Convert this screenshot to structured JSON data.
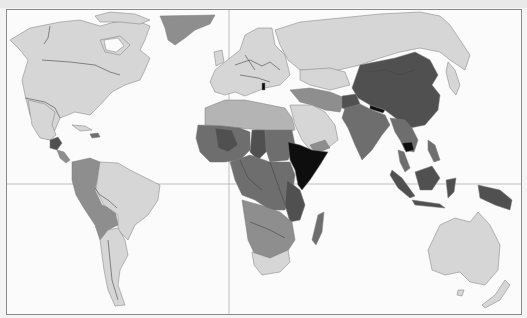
{
  "map": {
    "type": "choropleth",
    "projection": "equirectangular-like world map",
    "legend_visible": false,
    "title_visible": false,
    "gridlines": {
      "prime_meridian_x": 229,
      "equator_y": 184
    },
    "palette": {
      "ocean": "#fbfbfb",
      "shade_1_lowest": "#d6d6d6",
      "shade_2": "#b4b4b4",
      "shade_3": "#8e8e8e",
      "shade_4": "#6e6e6e",
      "shade_5": "#505050",
      "shade_6_highest": "#0e0e0e",
      "frame": "#8a8a8a",
      "grid": "#a8a8a8"
    },
    "regions": [
      {
        "name": "North America (Canada, USA)",
        "shade": "shade_1_lowest"
      },
      {
        "name": "Greenland",
        "shade": "shade_3"
      },
      {
        "name": "Mexico",
        "shade": "shade_1_lowest"
      },
      {
        "name": "Central America (Guatemala, Honduras)",
        "shade": "shade_5"
      },
      {
        "name": "Caribbean (Haiti)",
        "shade": "shade_4"
      },
      {
        "name": "South America west (Colombia, Ecuador, Peru, Bolivia)",
        "shade": "shade_3"
      },
      {
        "name": "Brazil, Argentina, Chile",
        "shade": "shade_1_lowest"
      },
      {
        "name": "Europe",
        "shade": "shade_1_lowest"
      },
      {
        "name": "Albania",
        "shade": "shade_6_highest"
      },
      {
        "name": "Russia",
        "shade": "shade_1_lowest"
      },
      {
        "name": "North Africa (Algeria, Libya, Egypt)",
        "shade": "shade_2"
      },
      {
        "name": "West Africa / Sahel",
        "shade": "shade_4"
      },
      {
        "name": "Mali, Chad",
        "shade": "shade_5"
      },
      {
        "name": "Central Africa",
        "shade": "shade_4"
      },
      {
        "name": "Ethiopia, Somalia, Eritrea",
        "shade": "shade_6_highest"
      },
      {
        "name": "Kenya, Tanzania",
        "shade": "shade_5"
      },
      {
        "name": "Southern Africa (Namibia, Botswana)",
        "shade": "shade_3"
      },
      {
        "name": "South Africa",
        "shade": "shade_1_lowest"
      },
      {
        "name": "Madagascar",
        "shade": "shade_4"
      },
      {
        "name": "Middle East / Arabia",
        "shade": "shade_1_lowest"
      },
      {
        "name": "Iraq, Iran",
        "shade": "shade_3"
      },
      {
        "name": "Afghanistan",
        "shade": "shade_5"
      },
      {
        "name": "India, Pakistan",
        "shade": "shade_4"
      },
      {
        "name": "China, Mongolia",
        "shade": "shade_5"
      },
      {
        "name": "Nepal, Bhutan",
        "shade": "shade_6_highest"
      },
      {
        "name": "Cambodia",
        "shade": "shade_6_highest"
      },
      {
        "name": "Southeast Asia",
        "shade": "shade_4"
      },
      {
        "name": "Indonesia, Papua",
        "shade": "shade_5"
      },
      {
        "name": "Japan",
        "shade": "shade_1_lowest"
      },
      {
        "name": "Australia, New Zealand",
        "shade": "shade_1_lowest"
      }
    ]
  }
}
